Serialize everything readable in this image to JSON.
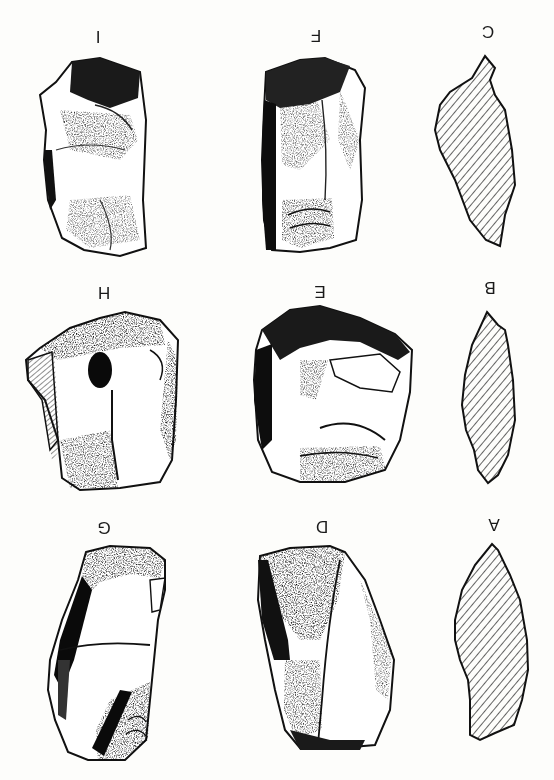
{
  "figure": {
    "orientation": "rotated 180 degrees",
    "background_color": "#fdfdfb",
    "ink_color": "#111111",
    "rows": [
      {
        "row": 1,
        "items": [
          {
            "id": "I",
            "label": "I",
            "type": "artifact-drawing",
            "x": 98,
            "y": 37
          },
          {
            "id": "F",
            "label": "F",
            "type": "artifact-drawing",
            "x": 316,
            "y": 36
          },
          {
            "id": "C",
            "label": "C",
            "type": "cross-section",
            "x": 488,
            "y": 32
          }
        ]
      },
      {
        "row": 2,
        "items": [
          {
            "id": "H",
            "label": "H",
            "type": "artifact-drawing",
            "x": 104,
            "y": 293
          },
          {
            "id": "E",
            "label": "E",
            "type": "artifact-drawing",
            "x": 320,
            "y": 292
          },
          {
            "id": "B",
            "label": "B",
            "type": "cross-section",
            "x": 490,
            "y": 288
          }
        ]
      },
      {
        "row": 3,
        "items": [
          {
            "id": "G",
            "label": "G",
            "type": "artifact-drawing",
            "x": 104,
            "y": 528
          },
          {
            "id": "D",
            "label": "D",
            "type": "artifact-drawing",
            "x": 322,
            "y": 527
          },
          {
            "id": "A",
            "label": "A",
            "type": "cross-section",
            "x": 494,
            "y": 525
          }
        ]
      }
    ],
    "labels": {
      "A": "A",
      "B": "B",
      "C": "C",
      "D": "D",
      "E": "E",
      "F": "F",
      "G": "G",
      "H": "H",
      "I": "I"
    }
  }
}
